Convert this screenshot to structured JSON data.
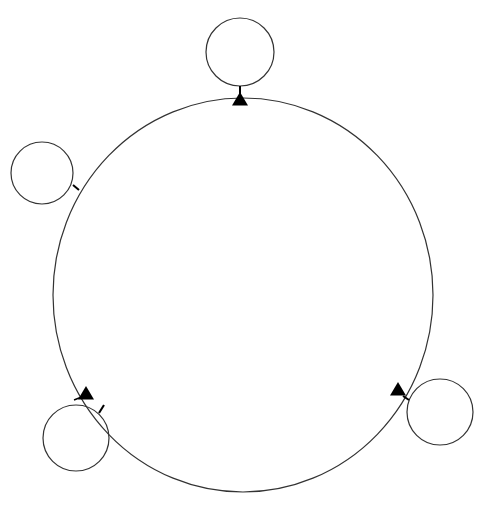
{
  "diagram": {
    "stroke_color": "#333333",
    "fill_marker": "#000000",
    "background": "#ffffff",
    "main_circle": {
      "cx": 243,
      "cy": 295,
      "rx": 190,
      "ry": 197
    },
    "nodes": [
      {
        "id": "top",
        "cx": 240,
        "cy": 52,
        "r": 34,
        "stub": [
          240,
          86,
          240,
          98
        ],
        "marker": {
          "x": 240,
          "y": 100,
          "dir": "up"
        }
      },
      {
        "id": "left",
        "cx": 42,
        "cy": 173,
        "r": 31,
        "stub": [
          73,
          185,
          79,
          190
        ],
        "marker": null
      },
      {
        "id": "bottom-left",
        "cx": 76,
        "cy": 438,
        "r": 33,
        "stub": [
          99,
          413,
          104,
          405
        ],
        "marker": {
          "x": 86,
          "y": 394,
          "dir": "up"
        }
      },
      {
        "id": "right",
        "cx": 440,
        "cy": 412,
        "r": 33,
        "stub": [
          409,
          400,
          403,
          396
        ],
        "marker": {
          "x": 398,
          "y": 390,
          "dir": "up"
        }
      }
    ],
    "extra_ticks": [
      {
        "x1": 74,
        "y1": 400,
        "x2": 84,
        "y2": 396
      }
    ]
  }
}
